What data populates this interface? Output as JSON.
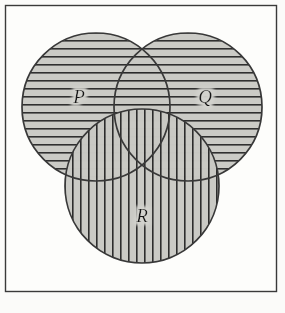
{
  "figure": {
    "kind": "venn-diagram",
    "caption": "",
    "frame": {
      "x": 5,
      "y": 5,
      "width": 272,
      "height": 287,
      "border_color": "#3a3a3a",
      "fill_color": "#fdfdfb"
    },
    "page_background": "#fbfbf9",
    "set_fill_color": "#c9c9c4",
    "hatch_color": "#2a2a2a",
    "outline_color": "#383838",
    "sets": [
      {
        "id": "P",
        "label": "P",
        "hatch": "horizontal",
        "cx": 96,
        "cy": 107,
        "r": 74,
        "label_x": 79,
        "label_y": 99
      },
      {
        "id": "Q",
        "label": "Q",
        "hatch": "horizontal",
        "cx": 188,
        "cy": 107,
        "r": 74,
        "label_x": 205,
        "label_y": 99
      },
      {
        "id": "R",
        "label": "R",
        "hatch": "vertical",
        "cx": 142,
        "cy": 186,
        "r": 77,
        "label_x": 142,
        "label_y": 218
      }
    ],
    "hatch_spacing_px": 8,
    "hatch_line_width_px": 1.6
  }
}
